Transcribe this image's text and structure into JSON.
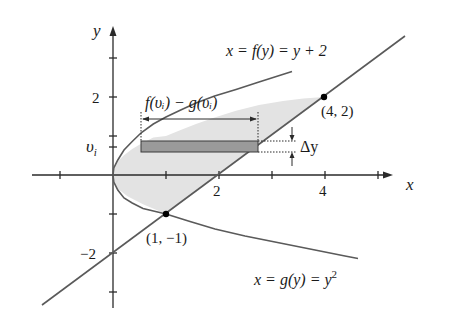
{
  "figure": {
    "axis_labels": {
      "x": "x",
      "y": "y"
    },
    "x_tick_labels": [
      {
        "value": 2,
        "label": "2"
      },
      {
        "value": 4,
        "label": "4"
      }
    ],
    "y_tick_labels": [
      {
        "value": 2,
        "label": "2"
      },
      {
        "value": -2,
        "label": "−2"
      }
    ],
    "vi_label": "υ",
    "vi_subscript": "i",
    "curve_f": {
      "label_prefix": "x = f(y) = y + 2",
      "expression": "x = y + 2"
    },
    "curve_g": {
      "label_main": "x = g(y) = y",
      "label_sup": "2",
      "expression": "x = y^2"
    },
    "width_label": "f(υᵢ) − g(υᵢ)",
    "delta_label": "Δy",
    "points": [
      {
        "label": "(4, 2)",
        "x": 4,
        "y": 2
      },
      {
        "label": "(1, −1)",
        "x": 1,
        "y": -1
      }
    ],
    "colors": {
      "curve": "#5a5a5a",
      "region_fill": "#e3e3e3",
      "rect_fill": "#9a9a9a",
      "axis": "#2a2a2a",
      "point": "#000000"
    }
  }
}
